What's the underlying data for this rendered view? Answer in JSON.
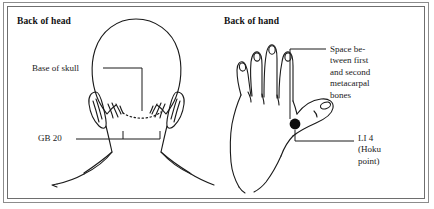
{
  "figure": {
    "panels": [
      {
        "heading": "Back of head",
        "labels": [
          {
            "name": "base-of-skull",
            "text": "Base of skull"
          },
          {
            "name": "gb-20",
            "text": "GB 20"
          }
        ]
      },
      {
        "heading": "Back of hand",
        "labels": [
          {
            "name": "space-between-metacarpals",
            "text": "Space be-\ntween first\nand second\nmetacarpal\nbones"
          },
          {
            "name": "li-4",
            "text": "LI 4\n(Hoku\npoint)"
          }
        ]
      }
    ],
    "colors": {
      "ink": "#1a1a1a",
      "frame_outer": "#8c8c8c",
      "frame_inner": "#6e6e6e",
      "acupoint_marker": "#0d0d0d",
      "paper": "#ffffff"
    }
  }
}
